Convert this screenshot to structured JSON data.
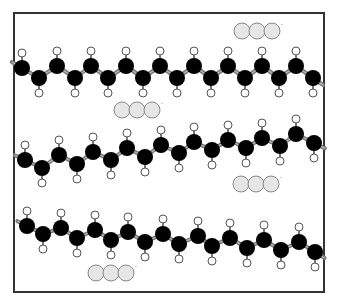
{
  "diagram": {
    "width": 338,
    "height": 304,
    "frame": {
      "x": 14,
      "y": 13,
      "width": 310,
      "height": 279,
      "stroke": "#333333",
      "stroke_width": 2
    },
    "colors": {
      "carbon": "#000000",
      "hydrogen_fill": "#ffffff",
      "hydrogen_stroke": "#555555",
      "bond": "#777777",
      "bond_highlight": "#bbbbbb",
      "ion_fill": "#e6e6e6",
      "ion_stroke": "#888888"
    },
    "carbon_radius": 8,
    "hydrogen_radius": 4,
    "hydrogen_offset": 15,
    "chains": [
      {
        "name": "chain-1",
        "carbons": [
          [
            22,
            68
          ],
          [
            39,
            78
          ],
          [
            57,
            66
          ],
          [
            75,
            78
          ],
          [
            91,
            66
          ],
          [
            108,
            78
          ],
          [
            126,
            66
          ],
          [
            143,
            78
          ],
          [
            160,
            66
          ],
          [
            177,
            78
          ],
          [
            194,
            66
          ],
          [
            211,
            78
          ],
          [
            228,
            66
          ],
          [
            245,
            78
          ],
          [
            262,
            66
          ],
          [
            279,
            78
          ],
          [
            296,
            66
          ],
          [
            313,
            78
          ]
        ]
      },
      {
        "name": "chain-2",
        "carbons": [
          [
            25,
            160
          ],
          [
            42,
            168
          ],
          [
            59,
            155
          ],
          [
            77,
            164
          ],
          [
            93,
            152
          ],
          [
            111,
            160
          ],
          [
            127,
            148
          ],
          [
            145,
            157
          ],
          [
            161,
            145
          ],
          [
            179,
            153
          ],
          [
            194,
            142
          ],
          [
            212,
            150
          ],
          [
            228,
            140
          ],
          [
            246,
            148
          ],
          [
            262,
            138
          ],
          [
            280,
            146
          ],
          [
            296,
            134
          ],
          [
            314,
            143
          ]
        ]
      },
      {
        "name": "chain-3",
        "carbons": [
          [
            27,
            226
          ],
          [
            43,
            234
          ],
          [
            61,
            228
          ],
          [
            77,
            238
          ],
          [
            95,
            230
          ],
          [
            111,
            240
          ],
          [
            128,
            232
          ],
          [
            145,
            242
          ],
          [
            163,
            234
          ],
          [
            179,
            244
          ],
          [
            198,
            236
          ],
          [
            212,
            246
          ],
          [
            230,
            238
          ],
          [
            247,
            248
          ],
          [
            264,
            240
          ],
          [
            281,
            250
          ],
          [
            299,
            242
          ],
          [
            315,
            252
          ]
        ]
      }
    ],
    "ion_groups": [
      {
        "name": "ion-group-1",
        "x": 242,
        "y": 31,
        "balls": 3,
        "radius": 8,
        "charge": "-"
      },
      {
        "name": "ion-group-2",
        "x": 122,
        "y": 110,
        "balls": 3,
        "radius": 8,
        "charge": "-"
      },
      {
        "name": "ion-group-3",
        "x": 241,
        "y": 184,
        "balls": 3,
        "radius": 8,
        "charge": "-"
      },
      {
        "name": "ion-group-4",
        "x": 96,
        "y": 273,
        "balls": 3,
        "radius": 8,
        "charge": "-"
      }
    ]
  }
}
